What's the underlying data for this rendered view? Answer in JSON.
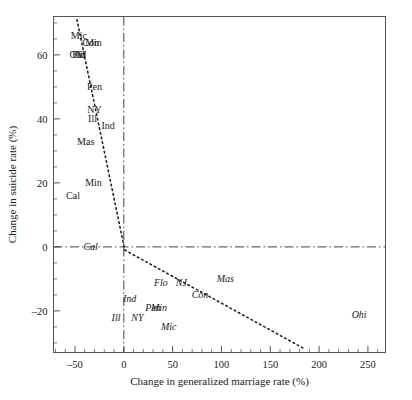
{
  "chart_data": {
    "type": "scatter",
    "title": "",
    "xlabel": "Change in generalized marriage rate (%)",
    "ylabel": "Change in suicide rate (%)",
    "xlim": [
      -72,
      268
    ],
    "ylim": [
      -33,
      72
    ],
    "xticks": [
      -50,
      0,
      50,
      100,
      150,
      200,
      250
    ],
    "xticklabels": [
      "‒50",
      "0",
      "50",
      "100",
      "150",
      "200",
      "250"
    ],
    "yticks": [
      -20,
      0,
      20,
      40,
      60
    ],
    "yticklabels": [
      "‒20",
      "0",
      "20",
      "40",
      "60"
    ],
    "xminor_step": 10,
    "yminor_step": 5,
    "grid": false,
    "legend": "none",
    "reference_lines": [
      {
        "name": "vertical-zero-line",
        "orientation": "vertical",
        "value": 0,
        "style": "dash-dot"
      },
      {
        "name": "horizontal-zero-line",
        "orientation": "horizontal",
        "value": 0,
        "style": "dash-dot"
      }
    ],
    "fit_lines": [
      {
        "name": "upper-fit-line",
        "style": "dotted",
        "x": [
          -48,
          1
        ],
        "y": [
          71,
          -1
        ]
      },
      {
        "name": "lower-fit-line",
        "style": "dotted",
        "x": [
          1,
          186
        ],
        "y": [
          -1,
          -32
        ]
      }
    ],
    "series": [
      {
        "name": "upright-labels",
        "style": "upright",
        "points": [
          {
            "label": "Mic",
            "x": -46,
            "y": 66
          },
          {
            "label": "Con",
            "x": -34,
            "y": 64
          },
          {
            "label": "Min",
            "x": -31,
            "y": 64
          },
          {
            "label": "Ohi",
            "x": -48,
            "y": 60
          },
          {
            "label": "Flo",
            "x": -46,
            "y": 60
          },
          {
            "label": "NJ",
            "x": -44,
            "y": 60
          },
          {
            "label": "Pen",
            "x": -30,
            "y": 50
          },
          {
            "label": "NY",
            "x": -30,
            "y": 43
          },
          {
            "label": "Ill",
            "x": -32,
            "y": 40
          },
          {
            "label": "Ind",
            "x": -16,
            "y": 38
          },
          {
            "label": "Mas",
            "x": -39,
            "y": 33
          },
          {
            "label": "Min",
            "x": -31,
            "y": 20
          },
          {
            "label": "Cal",
            "x": -52,
            "y": 16
          }
        ]
      },
      {
        "name": "italic-labels",
        "style": "italic",
        "points": [
          {
            "label": "Cal",
            "x": -34,
            "y": 0
          },
          {
            "label": "Flo",
            "x": 38,
            "y": -11
          },
          {
            "label": "NJ",
            "x": 59,
            "y": -11
          },
          {
            "label": "Mas",
            "x": 104,
            "y": -10
          },
          {
            "label": "Ind",
            "x": 6,
            "y": -16
          },
          {
            "label": "Con",
            "x": 78,
            "y": -15
          },
          {
            "label": "Pen",
            "x": 30,
            "y": -19
          },
          {
            "label": "Min",
            "x": 36,
            "y": -19
          },
          {
            "label": "Ill",
            "x": -8,
            "y": -22
          },
          {
            "label": "NY",
            "x": 14,
            "y": -22
          },
          {
            "label": "Mic",
            "x": 46,
            "y": -25
          },
          {
            "label": "Ohi",
            "x": 241,
            "y": -21
          }
        ]
      }
    ]
  },
  "figure": {
    "background": "#ffffff",
    "axis_color": "#555555",
    "text_color": "#1a1a1a"
  }
}
